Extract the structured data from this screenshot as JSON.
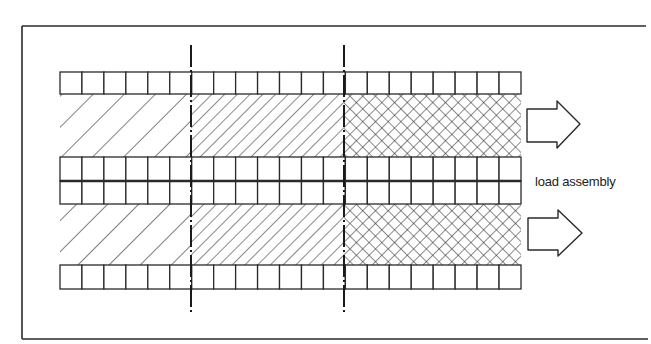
{
  "diagram": {
    "title": "",
    "label": "load assembly",
    "colors": {
      "ink": "#2a2a2a",
      "background": "#ffffff"
    },
    "frame": {
      "left": 22,
      "top": 26,
      "right": 646,
      "bottom": 339
    },
    "cells": {
      "x0": 60,
      "x1": 521,
      "count": 21
    },
    "rows": [
      {
        "name": "top-cell-row",
        "type": "cells",
        "y0": 72,
        "y1": 94
      },
      {
        "name": "upper-material-band",
        "type": "band",
        "y0": 94,
        "y1": 157
      },
      {
        "name": "middle-cell-row-upper",
        "type": "cells",
        "y0": 157,
        "y1": 181
      },
      {
        "name": "middle-cell-row-lower",
        "type": "cells",
        "y0": 181,
        "y1": 204
      },
      {
        "name": "lower-material-band",
        "type": "band",
        "y0": 204,
        "y1": 265
      },
      {
        "name": "bottom-cell-row",
        "type": "cells",
        "y0": 265,
        "y1": 289
      }
    ],
    "zones": [
      {
        "name": "coarse-hatch-zone",
        "pattern": "coarse-diagonal",
        "x0": 60,
        "x1": 191
      },
      {
        "name": "fine-hatch-zone",
        "pattern": "fine-diagonal",
        "x0": 191,
        "x1": 344
      },
      {
        "name": "crosshatch-zone",
        "pattern": "crosshatch",
        "x0": 344,
        "x1": 521
      }
    ],
    "centerlines": [
      {
        "name": "centerline-1",
        "x": 191,
        "y0": 45,
        "y1": 315
      },
      {
        "name": "centerline-2",
        "x": 344,
        "y0": 45,
        "y1": 315
      }
    ],
    "arrows": [
      {
        "name": "output-arrow-upper",
        "direction": "right",
        "y_center": 124
      },
      {
        "name": "output-arrow-lower",
        "direction": "right",
        "y_center": 233
      }
    ]
  }
}
